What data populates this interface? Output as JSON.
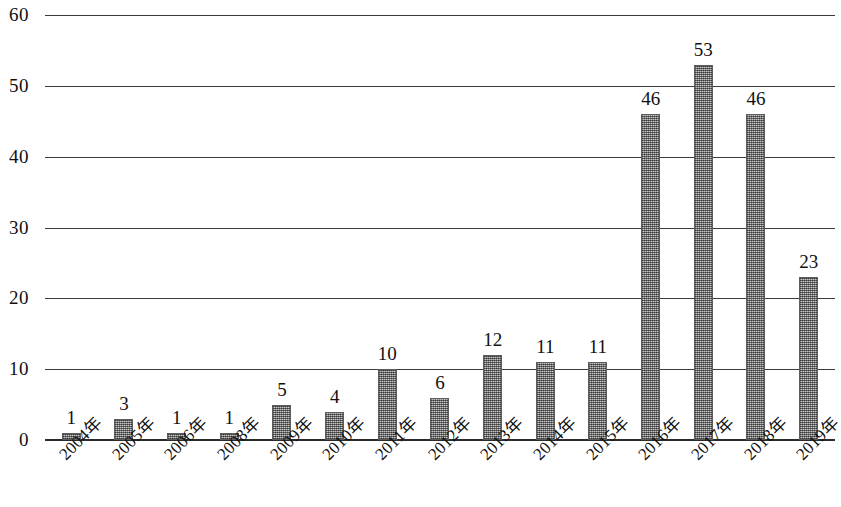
{
  "chart_data": {
    "type": "bar",
    "title": "",
    "subtitle": "",
    "xlabel": "",
    "ylabel": "",
    "categories": [
      "2004年",
      "2005年",
      "2006年",
      "2008年",
      "2009年",
      "2010年",
      "2011年",
      "2012年",
      "2013年",
      "2014年",
      "2015年",
      "2016年",
      "2017年",
      "2018年",
      "2019年"
    ],
    "values": [
      1,
      3,
      1,
      1,
      5,
      4,
      10,
      6,
      12,
      11,
      11,
      46,
      53,
      46,
      23
    ],
    "data_labels": [
      "1",
      "3",
      "1",
      "1",
      "5",
      "4",
      "10",
      "6",
      "12",
      "11",
      "11",
      "46",
      "53",
      "46",
      "23"
    ],
    "ylim": [
      0,
      60
    ],
    "ytick_labels": [
      "60",
      "50",
      "40",
      "30",
      "20",
      "10",
      "0"
    ],
    "ytick_values": [
      60,
      50,
      40,
      30,
      20,
      10,
      0
    ],
    "grid": true,
    "grid_orientation": "horizontal",
    "legend": false,
    "legend_position": "none",
    "series": [
      {
        "name": "",
        "values": [
          1,
          3,
          1,
          1,
          5,
          4,
          10,
          6,
          12,
          11,
          11,
          46,
          53,
          46,
          23
        ]
      }
    ],
    "bar_fill_color": "#8a8a8a",
    "axis_color": "#2b2b2b",
    "text_color": "#101010",
    "background_color": "#ffffff",
    "annotations": []
  }
}
